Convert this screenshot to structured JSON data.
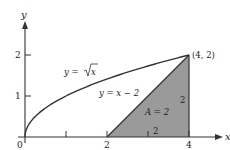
{
  "chart_data": {
    "type": "line",
    "title": "",
    "xlabel": "x",
    "ylabel": "y",
    "xlim": [
      0,
      4.8
    ],
    "ylim": [
      0,
      2.8
    ],
    "grid": false,
    "x_ticks": [
      0,
      1,
      2,
      3,
      4
    ],
    "x_tick_labels": [
      "0",
      "",
      "2",
      "",
      "4"
    ],
    "y_ticks": [
      1,
      2
    ],
    "y_tick_labels": [
      "1",
      "2"
    ],
    "series": [
      {
        "name": "y = √x",
        "function": "sqrt(x)",
        "x": [
          0,
          0.25,
          0.5,
          1,
          1.5,
          2,
          2.5,
          3,
          3.5,
          4
        ],
        "y": [
          0,
          0.5,
          0.707,
          1,
          1.225,
          1.414,
          1.581,
          1.732,
          1.871,
          2
        ]
      },
      {
        "name": "y = x − 2",
        "function": "x - 2",
        "x": [
          2,
          4
        ],
        "y": [
          0,
          2
        ]
      }
    ],
    "shaded_region": {
      "vertices": [
        [
          2,
          0
        ],
        [
          4,
          2
        ],
        [
          4,
          0
        ]
      ],
      "label": "A = 2",
      "color": "#9a9a9a"
    },
    "annotations": [
      {
        "text": "(4, 2)",
        "x": 4,
        "y": 2
      },
      {
        "text": "y = √x",
        "x": 1.2,
        "y": 1.55
      },
      {
        "text": "y = x − 2",
        "x": 1.9,
        "y": 1.05
      },
      {
        "text": "A = 2",
        "x": 3.2,
        "y": 0.55
      },
      {
        "text": "2",
        "x": 3.8,
        "y": 0.85
      },
      {
        "text": "2",
        "x": 3.1,
        "y": 0.12
      }
    ]
  },
  "labels": {
    "x_axis": "x",
    "y_axis": "y",
    "origin": "0",
    "x_tick_2": "2",
    "x_tick_4": "4",
    "y_tick_1": "1",
    "y_tick_2": "2",
    "point": "(4, 2)",
    "curve_sqrt_prefix": "y = ",
    "curve_sqrt_arg": "x",
    "line_label": "y = x − 2",
    "area_label": "A = 2",
    "side_vertical": "2",
    "side_horizontal": "2"
  },
  "colors": {
    "ink": "#333333",
    "shade": "#9a9a9a"
  }
}
